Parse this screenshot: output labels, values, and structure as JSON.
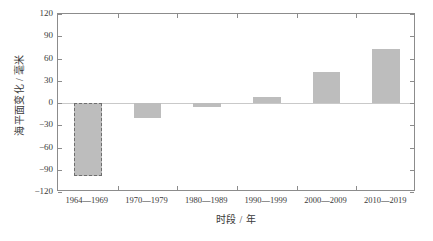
{
  "chart_data": {
    "type": "bar",
    "title": "",
    "xlabel": "时段 / 年",
    "ylabel": "海平面变化 / 毫米",
    "categories": [
      "1964—1969",
      "1970—1979",
      "1980—1989",
      "1990—1999",
      "2000—2009",
      "2010—2019"
    ],
    "values": [
      -98,
      -20,
      -6,
      8,
      42,
      73
    ],
    "ylim": [
      -120,
      120
    ],
    "yticks": [
      120,
      90,
      60,
      30,
      0,
      -30,
      -60,
      -90,
      -120
    ],
    "ytick_labels": [
      "120",
      "90",
      "60",
      "30",
      "0",
      "−30",
      "−60",
      "−90",
      "−120"
    ],
    "grid": false,
    "legend": null,
    "bar_fill_color": "#bdbdbd",
    "bar_edge_color": "#6e6e6e",
    "axis_color": "#8c8c8c",
    "zero_line_color": "#c9c9c9",
    "highlight": {
      "category": "1964—1969",
      "style": "dashed-border"
    }
  }
}
